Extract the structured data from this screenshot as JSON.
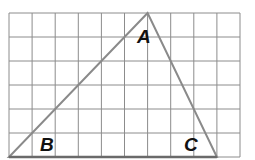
{
  "figure": {
    "type": "geometry-grid-triangle",
    "grid": {
      "columns": 10,
      "rows": 6,
      "origin_px": [
        9,
        13
      ],
      "cell_width_px": 23.1,
      "cell_height_px": 24,
      "line_color": "#8c8c8c"
    },
    "triangle": {
      "edge_color": "#8a8a8a",
      "vertices_grid": {
        "A": [
          6,
          0
        ],
        "B_corner": [
          0,
          6
        ],
        "C_corner": [
          9,
          6
        ]
      }
    },
    "labels": {
      "A": "A",
      "B": "B",
      "C": "C"
    }
  }
}
